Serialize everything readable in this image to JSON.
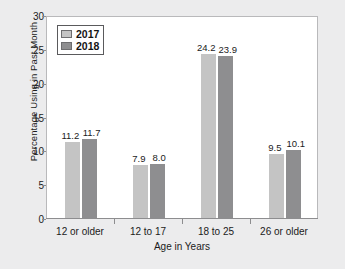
{
  "chart_data": {
    "type": "bar",
    "title": "",
    "xlabel": "Age in Years",
    "ylabel": "Percentage Using in Past Month",
    "categories": [
      "12 or older",
      "12 to 17",
      "18 to 25",
      "26 or older"
    ],
    "series": [
      {
        "name": "2017",
        "color": "#c4c4c4",
        "values": [
          11.2,
          7.9,
          24.2,
          9.5
        ]
      },
      {
        "name": "2018",
        "color": "#8e8e90",
        "values": [
          11.7,
          8.0,
          23.9,
          10.1
        ]
      }
    ],
    "value_labels": {
      "2017": [
        "11.2",
        "7.9",
        "24.2",
        "9.5"
      ],
      "2018": [
        "11.7",
        "8.0",
        "23.9",
        "10.1"
      ]
    },
    "ylim": [
      0,
      30
    ],
    "yticks": [
      "0",
      "5",
      "10",
      "15",
      "20",
      "25",
      "30"
    ],
    "grid": false,
    "legend_position": "top-left"
  },
  "legend": {
    "items": [
      {
        "label": "2017"
      },
      {
        "label": "2018"
      }
    ]
  }
}
